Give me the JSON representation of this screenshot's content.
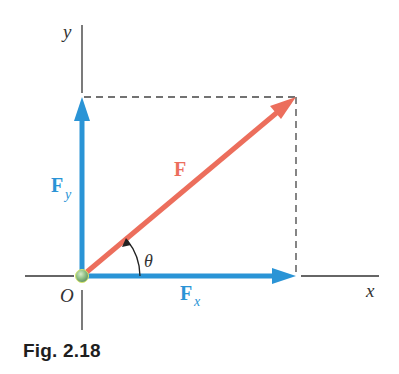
{
  "figure": {
    "caption": "Fig. 2.18",
    "axes": {
      "x_label": "x",
      "y_label": "y",
      "origin_label": "O"
    },
    "vectors": [
      {
        "id": "F",
        "label": "F",
        "subscript": "",
        "color": "#ec6e5c"
      },
      {
        "id": "Fx",
        "label": "F",
        "subscript": "x",
        "color": "#2a94d6"
      },
      {
        "id": "Fy",
        "label": "F",
        "subscript": "y",
        "color": "#2a94d6"
      }
    ],
    "angle_label": "θ",
    "colors": {
      "axis": "#333333",
      "dashed": "#444444",
      "force": "#ec6e5c",
      "component": "#2a94d6",
      "origin_dot": "#7fb57a"
    }
  }
}
